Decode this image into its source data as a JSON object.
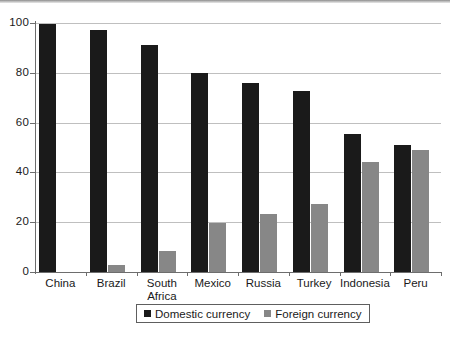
{
  "chart_data": {
    "type": "bar",
    "title": "",
    "subtitle": "",
    "xlabel": "",
    "ylabel": "",
    "ylim": [
      0,
      100
    ],
    "yticks": [
      0,
      20,
      40,
      60,
      80,
      100
    ],
    "grid": true,
    "legend_position": "bottom",
    "categories": [
      "China",
      "Brazil",
      "South\nAfrica",
      "Mexico",
      "Russia",
      "Turkey",
      "Indonesia",
      "Peru"
    ],
    "series": [
      {
        "name": "Domestic currency",
        "color": "#1a1a1a",
        "values": [
          99.5,
          97,
          91,
          80,
          76,
          72.5,
          55.5,
          51
        ]
      },
      {
        "name": "Foreign currency",
        "color": "#878787",
        "values": [
          0,
          3,
          8.5,
          19.5,
          23.5,
          27.5,
          44,
          49
        ]
      }
    ]
  },
  "axes": {
    "y_tick_labels": [
      "100",
      "80",
      "60",
      "40",
      "20",
      "0"
    ]
  },
  "legend": {
    "items": [
      {
        "label": "Domestic currency",
        "swatch": "domestic-swatch-icon"
      },
      {
        "label": "Foreign currency",
        "swatch": "foreign-swatch-icon"
      }
    ]
  },
  "colors": {
    "domestic": "#1a1a1a",
    "foreign": "#878787",
    "grid": "#bfbfbf",
    "axis": "#6d6d6d",
    "background": "#ffffff"
  }
}
